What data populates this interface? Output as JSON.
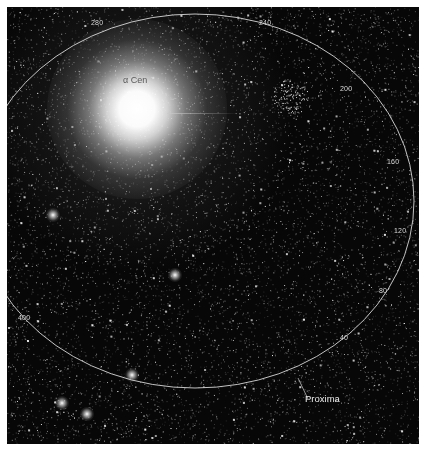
{
  "image": {
    "description": "Wide-field star image around Alpha Centauri with Proxima Centauri's orbit ellipse marked",
    "background_color": "#070707",
    "ellipse_color": "#d9d9d9"
  },
  "labels": {
    "primary_star": "α Cen",
    "proxima": "Proxima"
  },
  "orbit_ticks": [
    {
      "label": "280",
      "x": 84,
      "y": 18
    },
    {
      "label": "240",
      "x": 252,
      "y": 18
    },
    {
      "label": "200",
      "x": 333,
      "y": 84
    },
    {
      "label": "160",
      "x": 380,
      "y": 157
    },
    {
      "label": "120",
      "x": 387,
      "y": 226
    },
    {
      "label": "80",
      "x": 372,
      "y": 286
    },
    {
      "label": "40",
      "x": 333,
      "y": 333
    },
    {
      "label": "400",
      "x": 11,
      "y": 313
    }
  ],
  "orbit_ellipse": {
    "cx": 188,
    "cy": 194,
    "rx": 219,
    "ry": 187
  },
  "proxima_marker": {
    "line_x1": 291,
    "line_y1": 371,
    "line_x2": 301,
    "line_y2": 392,
    "label_x": 298,
    "label_y": 392
  },
  "bright_stars": [
    {
      "x": 55,
      "y": 396
    },
    {
      "x": 80,
      "y": 407
    },
    {
      "x": 46,
      "y": 208
    },
    {
      "x": 168,
      "y": 268
    },
    {
      "x": 125,
      "y": 368
    }
  ]
}
